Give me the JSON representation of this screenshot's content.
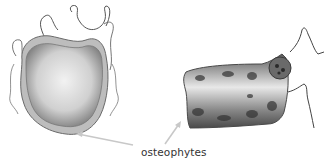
{
  "figure": {
    "label": "osteophytes",
    "colors": {
      "arrow": "#c8c8c8",
      "ink": "#555555",
      "label": "#333333"
    }
  }
}
